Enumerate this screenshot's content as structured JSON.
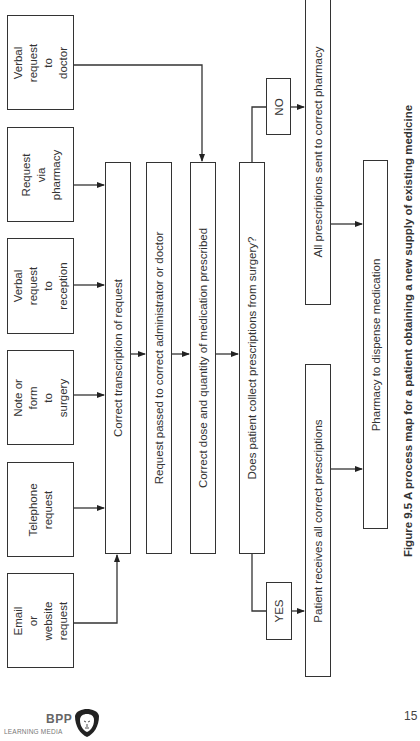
{
  "diagram": {
    "inputs": [
      {
        "id": "email",
        "label": "Email or\nwebsite\nrequest"
      },
      {
        "id": "telephone",
        "label": "Telephone\nrequest"
      },
      {
        "id": "note",
        "label": "Note or form\nto surgery"
      },
      {
        "id": "reception",
        "label": "Verbal request\nto reception"
      },
      {
        "id": "pharmacy_req",
        "label": "Request via\npharmacy"
      },
      {
        "id": "doctor",
        "label": "Verbal request\nto doctor"
      }
    ],
    "steps": [
      {
        "id": "transcription",
        "label": "Correct transcription of request"
      },
      {
        "id": "passed",
        "label": "Request passed to correct administrator or doctor"
      },
      {
        "id": "dose",
        "label": "Correct dose and quantity of medication prescribed"
      },
      {
        "id": "decision",
        "label": "Does patient collect prescriptions from surgery?"
      }
    ],
    "branches": {
      "yes": {
        "label": "YES",
        "outcome": "Patient receives all correct prescriptions"
      },
      "no": {
        "label": "NO",
        "outcome": "All prescriptions sent to correct pharmacy"
      }
    },
    "final": {
      "label": "Pharmacy to dispense medication"
    },
    "caption": "Figure 9.5 A process map for a patient obtaining a new supply of existing medicine"
  },
  "footer": {
    "logo_brand": "BPP",
    "logo_sub": "LEARNING MEDIA",
    "page_number": "15"
  }
}
